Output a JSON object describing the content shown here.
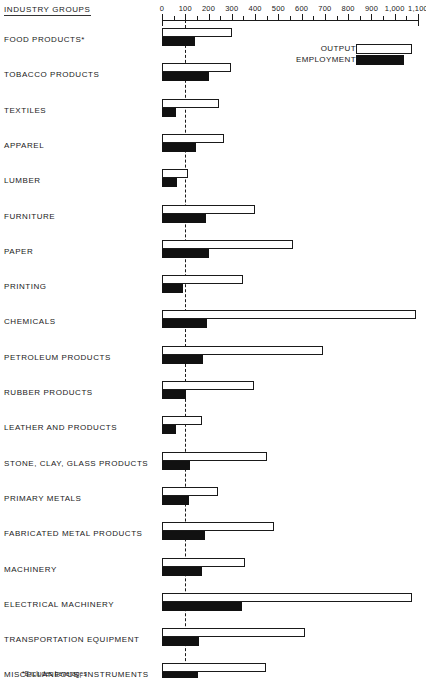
{
  "header": {
    "column_title": "INDUSTRY GROUPS"
  },
  "legend": {
    "items": [
      {
        "label": "OUTPUT",
        "kind": "output",
        "color": "#ffffff"
      },
      {
        "label": "EMPLOYMENT",
        "kind": "employment",
        "color": "#111111"
      }
    ]
  },
  "footnote": {
    "text": "*Excludes beverages"
  },
  "chart_data": {
    "type": "bar",
    "orientation": "horizontal",
    "title": "",
    "subtitle": "",
    "xlabel": "",
    "ylabel": "INDUSTRY GROUPS",
    "xlim": [
      0,
      1100
    ],
    "grid": false,
    "reference_line": 100,
    "legend_position": "top-right",
    "xticks": [
      0,
      100,
      200,
      300,
      400,
      500,
      600,
      700,
      800,
      900,
      1000,
      1100
    ],
    "xtick_labels": [
      "0",
      "100",
      "200",
      "300",
      "400",
      "500",
      "600",
      "700",
      "800",
      "900",
      "1,000",
      "1,100"
    ],
    "categories": [
      "FOOD PRODUCTS*",
      "TOBACCO PRODUCTS",
      "TEXTILES",
      "APPAREL",
      "LUMBER",
      "FURNITURE",
      "PAPER",
      "PRINTING",
      "CHEMICALS",
      "PETROLEUM PRODUCTS",
      "RUBBER PRODUCTS",
      "LEATHER AND PRODUCTS",
      "STONE, CLAY, GLASS PRODUCTS",
      "PRIMARY METALS",
      "FABRICATED METAL PRODUCTS",
      "MACHINERY",
      "ELECTRICAL MACHINERY",
      "TRANSPORTATION EQUIPMENT",
      "MISCELLANEOUS, INSTRUMENTS"
    ],
    "series": [
      {
        "name": "OUTPUT",
        "values": [
          300,
          295,
          245,
          265,
          110,
          400,
          565,
          350,
          1090,
          690,
          395,
          170,
          450,
          240,
          480,
          355,
          1075,
          615,
          445
        ]
      },
      {
        "name": "EMPLOYMENT",
        "values": [
          140,
          200,
          60,
          145,
          65,
          190,
          200,
          90,
          195,
          175,
          105,
          60,
          120,
          115,
          185,
          170,
          345,
          160,
          155
        ]
      }
    ]
  }
}
